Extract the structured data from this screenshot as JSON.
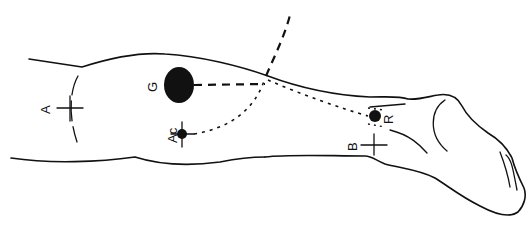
{
  "diagram": {
    "stroke_color": "#111111",
    "background": "#ffffff",
    "labels": {
      "A": "A",
      "G": "G",
      "Ac": "Ac",
      "B": "B",
      "R": "R"
    },
    "points": [
      {
        "id": "A",
        "marker": "cross"
      },
      {
        "id": "G",
        "marker": "large-filled-ellipse"
      },
      {
        "id": "Ac",
        "marker": "dot-with-cross"
      },
      {
        "id": "B",
        "marker": "cross"
      },
      {
        "id": "R",
        "marker": "dot"
      }
    ]
  }
}
